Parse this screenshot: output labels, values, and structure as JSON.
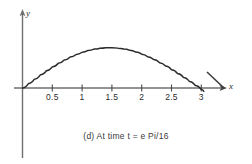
{
  "figure": {
    "caption": "(d) At time t = e Pi/16",
    "background_color": "#ffffff",
    "line_color": "#2b2b2b"
  },
  "axes": {
    "x_axis_label": "x",
    "y_axis_label": "y",
    "x_tick_labels": [
      "0.5",
      "1",
      "1.5",
      "2",
      "2.5",
      "3"
    ]
  },
  "chart_data": {
    "type": "line",
    "title": "",
    "subtitle": "(d) At time t = e Pi/16",
    "xlabel": "x",
    "ylabel": "y",
    "xlim": [
      0,
      3.35
    ],
    "ylim": [
      0,
      1.1
    ],
    "grid": false,
    "legend": null,
    "x_ticks": [
      0.5,
      1,
      1.5,
      2,
      2.5,
      3
    ],
    "x_tick_labels": [
      "0.5",
      "1",
      "1.5",
      "2",
      "2.5",
      "3"
    ],
    "y_ticks": [],
    "y_tick_labels": [],
    "series": [
      {
        "name": "u(x,t)",
        "x": [
          0,
          0.1,
          0.2,
          0.3,
          0.4,
          0.5,
          0.6,
          0.7,
          0.8,
          0.9,
          1.0,
          1.1,
          1.2,
          1.3,
          1.4,
          1.5,
          1.6,
          1.7,
          1.8,
          1.9,
          2.0,
          2.1,
          2.2,
          2.3,
          2.4,
          2.5,
          2.6,
          2.7,
          2.8,
          2.9,
          3.0,
          3.0416
        ],
        "values": [
          0,
          0.099,
          0.197,
          0.292,
          0.383,
          0.469,
          0.549,
          0.622,
          0.688,
          0.745,
          0.794,
          0.834,
          0.864,
          0.884,
          0.895,
          0.895,
          0.886,
          0.866,
          0.837,
          0.798,
          0.751,
          0.695,
          0.632,
          0.562,
          0.487,
          0.407,
          0.323,
          0.236,
          0.147,
          0.056,
          -0.035,
          -0.073
        ]
      }
    ]
  }
}
